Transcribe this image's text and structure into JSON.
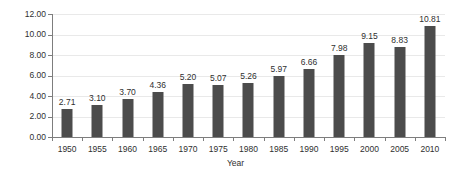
{
  "chart_data": {
    "type": "bar",
    "title": "",
    "subtitle": "",
    "xlabel": "Year",
    "ylabel": "",
    "categories": [
      "1950",
      "1955",
      "1960",
      "1965",
      "1970",
      "1975",
      "1980",
      "1985",
      "1990",
      "1995",
      "2000",
      "2005",
      "2010"
    ],
    "values": [
      2.71,
      3.1,
      3.7,
      4.36,
      5.2,
      5.07,
      5.26,
      5.97,
      6.66,
      7.98,
      9.15,
      8.83,
      10.81
    ],
    "data_labels": [
      "2.71",
      "3.10",
      "3.70",
      "4.36",
      "5.20",
      "5.07",
      "5.26",
      "5.97",
      "6.66",
      "7.98",
      "9.15",
      "8.83",
      "10.81"
    ],
    "ylim": [
      0,
      12
    ],
    "ytick_values": [
      0,
      2,
      4,
      6,
      8,
      10,
      12
    ],
    "ytick_labels": [
      "0.00",
      "2.00",
      "4.00",
      "6.00",
      "8.00",
      "10.00",
      "12.00"
    ],
    "grid": true,
    "legend": false,
    "legend_position": "none",
    "series": [
      {
        "name": "",
        "values": [
          2.71,
          3.1,
          3.7,
          4.36,
          5.2,
          5.07,
          5.26,
          5.97,
          6.66,
          7.98,
          9.15,
          8.83,
          10.81
        ]
      }
    ]
  },
  "style": {
    "bar_color": "#4c4c4c",
    "grid_color": "#e9e9e9",
    "axis_color": "#7d7d7d",
    "text_color": "#2f2f2f",
    "background": "#ffffff"
  }
}
